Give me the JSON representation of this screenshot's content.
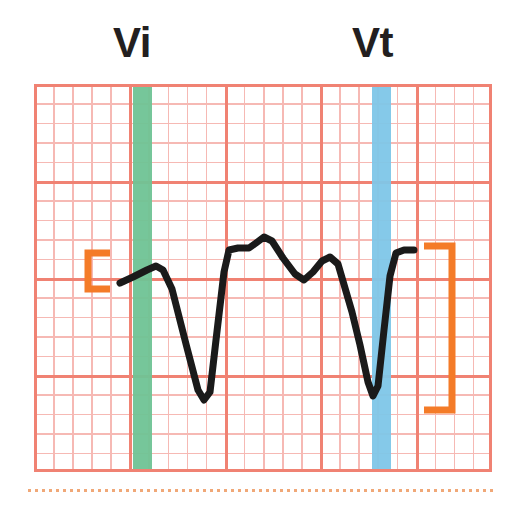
{
  "figure": {
    "background_color": "#ffffff",
    "width": 525,
    "height": 505
  },
  "labels": {
    "vi": "Vi",
    "vt": "Vt",
    "color": "#231f20"
  },
  "grid": {
    "minor_color": "#f6b9b4",
    "major_color": "#f08273",
    "border_color": "#f08273",
    "minor_spacing_px": 19,
    "major_spacing_px": 95,
    "columns_major": 5,
    "rows_major": 4
  },
  "markers": [
    {
      "name": "Vi",
      "label": "Vi",
      "color": "#6fc395",
      "x_px": 133,
      "width_px": 19,
      "description": "green vertical band marking initial voltage"
    },
    {
      "name": "Vt",
      "label": "Vt",
      "color": "#7ec6e8",
      "x_px": 372,
      "width_px": 19,
      "description": "blue vertical band marking terminal voltage"
    }
  ],
  "brackets": [
    {
      "name": "left-bracket",
      "orientation": "left",
      "color": "#f47b28",
      "x_px": 88,
      "y_top_px": 253,
      "y_bottom_px": 289,
      "arm_px": 22,
      "thickness_px": 7
    },
    {
      "name": "right-bracket",
      "orientation": "right",
      "color": "#f47b28",
      "x_px": 452,
      "y_top_px": 246,
      "y_bottom_px": 410,
      "arm_px": 28,
      "thickness_px": 7
    }
  ],
  "chart_data": {
    "type": "line",
    "xlabel": "",
    "ylabel": "",
    "legend_position": "none",
    "grid": true,
    "xlim": [
      34,
      492
    ],
    "ylim": [
      84,
      472
    ],
    "series": [
      {
        "name": "ecg-trace",
        "color": "#1a1a1a",
        "line_width": 7,
        "points": [
          [
            120,
            283
          ],
          [
            133,
            277
          ],
          [
            147,
            270
          ],
          [
            156,
            266
          ],
          [
            163,
            270
          ],
          [
            172,
            289
          ],
          [
            186,
            344
          ],
          [
            198,
            390
          ],
          [
            204,
            400
          ],
          [
            210,
            392
          ],
          [
            216,
            340
          ],
          [
            224,
            272
          ],
          [
            229,
            250
          ],
          [
            238,
            248
          ],
          [
            249,
            248
          ],
          [
            256,
            243
          ],
          [
            264,
            237
          ],
          [
            272,
            241
          ],
          [
            283,
            258
          ],
          [
            295,
            274
          ],
          [
            304,
            280
          ],
          [
            313,
            272
          ],
          [
            322,
            261
          ],
          [
            330,
            257
          ],
          [
            338,
            264
          ],
          [
            345,
            288
          ],
          [
            352,
            312
          ],
          [
            360,
            345
          ],
          [
            368,
            382
          ],
          [
            373,
            396
          ],
          [
            378,
            386
          ],
          [
            384,
            330
          ],
          [
            390,
            276
          ],
          [
            396,
            253
          ],
          [
            404,
            250
          ],
          [
            414,
            250
          ]
        ]
      }
    ]
  }
}
